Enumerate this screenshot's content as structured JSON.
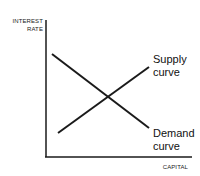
{
  "diagram": {
    "y_axis_label_line1": "INTEREST",
    "y_axis_label_line2": "RATE",
    "x_axis_label": "CAPITAL",
    "supply_label_line1": "Supply",
    "supply_label_line2": "curve",
    "demand_label_line1": "Demand",
    "demand_label_line2": "curve",
    "line_color": "#1a1a1a"
  }
}
